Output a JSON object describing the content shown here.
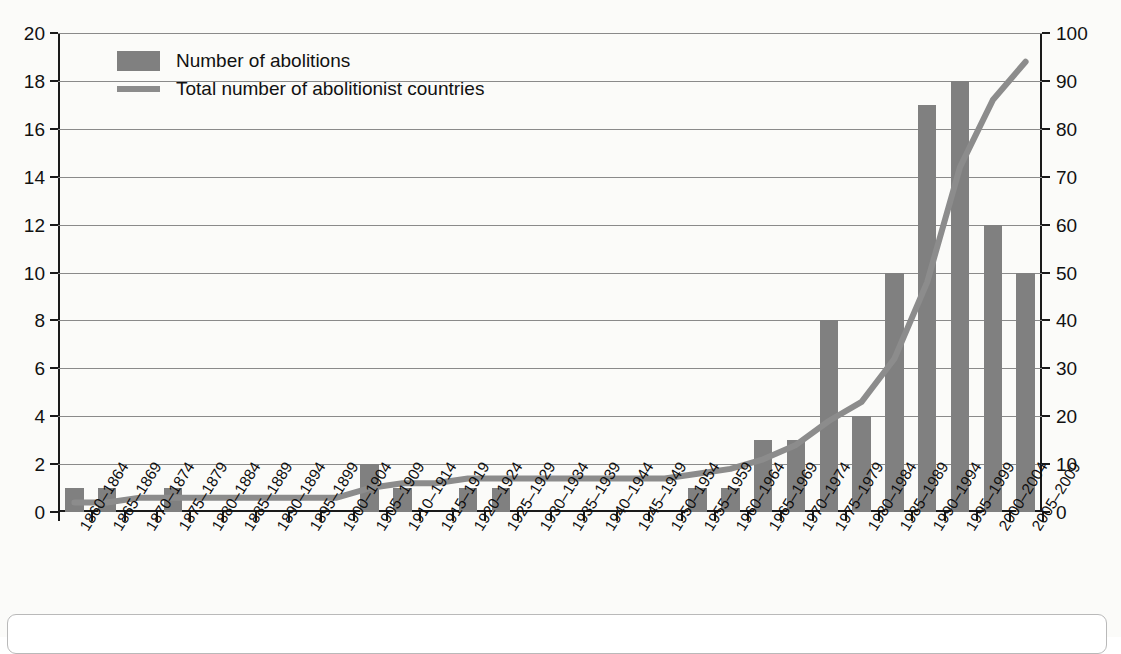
{
  "chart_data": {
    "type": "bar",
    "title": "",
    "xlabel": "",
    "ylabel": "",
    "ylim": [
      0,
      20
    ],
    "y2lim": [
      0,
      100
    ],
    "grid": true,
    "legend_position": "top-left",
    "categories": [
      "1860–1864",
      "1865–1869",
      "1870–1874",
      "1875–1879",
      "1880–1884",
      "1885–1889",
      "1890–1894",
      "1895–1899",
      "1900–1904",
      "1905–1909",
      "1910–1914",
      "1915–1919",
      "1920–1924",
      "1925–1929",
      "1930–1934",
      "1935–1939",
      "1940–1944",
      "1945–1949",
      "1950–1954",
      "1955–1959",
      "1960–1964",
      "1965–1969",
      "1970–1974",
      "1975–1979",
      "1980–1984",
      "1985–1989",
      "1990–1994",
      "1995–1999",
      "2000–2004",
      "2005–2009"
    ],
    "series": [
      {
        "name": "Number of abolitions",
        "kind": "bar",
        "axis": "left",
        "color": "#808080",
        "values": [
          1,
          1,
          0,
          1,
          0,
          0,
          0,
          0,
          0,
          2,
          1,
          0,
          1,
          1,
          0,
          0,
          0,
          0,
          0,
          1,
          1,
          3,
          3,
          8,
          4,
          10,
          17,
          18,
          12,
          10
        ]
      },
      {
        "name": "Total number of abolitionist countries",
        "kind": "line",
        "axis": "right",
        "color": "#8c8c8c",
        "values": [
          2,
          2,
          3,
          3,
          3,
          3,
          3,
          3,
          3,
          5,
          6,
          6,
          7,
          7,
          7,
          7,
          7,
          7,
          7,
          8,
          9,
          11,
          14,
          19,
          23,
          32,
          48,
          72,
          86,
          94
        ]
      }
    ],
    "y_ticks_left": [
      0,
      2,
      4,
      6,
      8,
      10,
      12,
      14,
      16,
      18,
      20
    ],
    "y_ticks_right": [
      0,
      10,
      20,
      30,
      40,
      50,
      60,
      70,
      80,
      90,
      100
    ]
  },
  "legend": {
    "bar_label": "Number of abolitions",
    "line_label": "Total number of abolitionist countries",
    "bar_swatch_icon": "bar-swatch",
    "line_swatch_icon": "line-swatch"
  }
}
